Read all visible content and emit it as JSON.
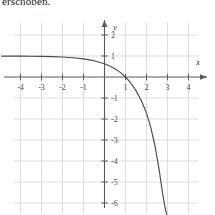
{
  "caption": {
    "text": "erschoben."
  },
  "chart_data": {
    "type": "line",
    "title": "",
    "subtitle": "",
    "xlabel": "x",
    "ylabel": "y",
    "xlim": [
      -4.9,
      5.2
    ],
    "ylim": [
      -6.6,
      2.7
    ],
    "xticks": [
      -4,
      -3,
      -2,
      -1,
      1,
      2,
      3,
      4
    ],
    "yticks": [
      2,
      1,
      -1,
      -2,
      -3,
      -4,
      -5,
      -6
    ],
    "xtick_labels": [
      "-4",
      "-3",
      "-2",
      "-1",
      "1",
      "2",
      "3",
      "4"
    ],
    "ytick_labels": [
      "2",
      "1",
      "-1",
      "-2",
      "-3",
      "-4",
      "-5",
      "-6"
    ],
    "grid": true,
    "grid_color": "#c9cfd6",
    "axis_color": "#5a5a5a",
    "curve_color": "#4a4a4a",
    "legend": "none",
    "series": [
      {
        "name": "curve",
        "description": "decreasing exponential; horizontal asymptote y=1 to the left, zero crossing at x=1, steep fall for x>2",
        "x": [
          -4.9,
          -4.5,
          -4.0,
          -3.5,
          -3.0,
          -2.5,
          -2.0,
          -1.5,
          -1.0,
          -0.5,
          0.0,
          0.25,
          0.5,
          0.75,
          1.0,
          1.25,
          1.5,
          1.75,
          2.0,
          2.2,
          2.4,
          2.6,
          2.75,
          2.9,
          2.98
        ],
        "y": [
          0.997,
          0.996,
          0.993,
          0.989,
          0.982,
          0.97,
          0.95,
          0.917,
          0.865,
          0.777,
          0.632,
          0.528,
          0.393,
          0.221,
          0.0,
          -0.284,
          -0.649,
          -1.117,
          -1.718,
          -2.39,
          -3.262,
          -4.395,
          -5.44,
          -6.3,
          -6.6
        ]
      }
    ],
    "zero_crossing_x": 1,
    "left_asymptote_y": 1
  }
}
